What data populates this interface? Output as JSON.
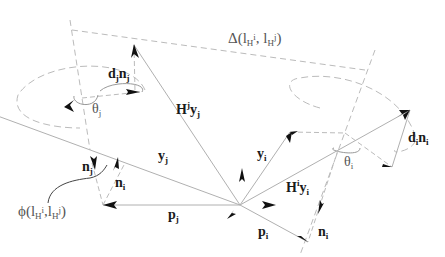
{
  "diagram": {
    "labels": {
      "delta": {
        "main": "Δ(l",
        "s1": "H",
        "sup1": "i",
        "mid": ", l",
        "s2": "H",
        "sup2": "j",
        "end": ")"
      },
      "phi": {
        "main": "ϕ(l",
        "s1": "H",
        "sup1": "i",
        "mid": ",l",
        "s2": "H",
        "sup2": "j",
        "end": ")"
      },
      "dj_nj": {
        "a": "d",
        "as": "j",
        "b": "n",
        "bs": "j"
      },
      "di_ni": {
        "a": "d",
        "as": "i",
        "b": "n",
        "bs": "i"
      },
      "theta_j": {
        "a": "θ",
        "as": "j"
      },
      "theta_i": {
        "a": "θ",
        "as": "i"
      },
      "Hj_yj": {
        "a": "H",
        "sup": "j",
        "b": "y",
        "bs": "j"
      },
      "Hi_yi": {
        "a": "H",
        "sup": "i",
        "b": "y",
        "bs": "i"
      },
      "y_j": {
        "a": "y",
        "as": "j"
      },
      "y_i": {
        "a": "y",
        "as": "i"
      },
      "p_j": {
        "a": "p",
        "as": "j"
      },
      "p_i": {
        "a": "p",
        "as": "i"
      },
      "n_j": {
        "a": "n",
        "as": "j"
      },
      "n_i_left": {
        "a": "n",
        "as": "i"
      },
      "n_i_bottom": {
        "a": "n",
        "as": "i"
      }
    },
    "colors": {
      "vector": "#b0b0b0",
      "dashed": "#b8b8b8",
      "arrow": "#111111",
      "text": "#1a1a1a"
    }
  }
}
